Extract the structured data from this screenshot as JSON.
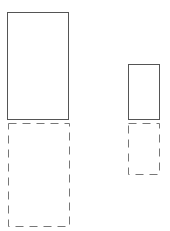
{
  "diagram": {
    "colors": {
      "solid_stroke": "#555555",
      "dashed_stroke": "#777777",
      "background": "#ffffff"
    },
    "shapes": [
      {
        "name": "left-solid-box",
        "style": "solid"
      },
      {
        "name": "left-dashed-box",
        "style": "dashed"
      },
      {
        "name": "right-solid-box",
        "style": "solid"
      },
      {
        "name": "right-dashed-box",
        "style": "dashed"
      }
    ]
  }
}
